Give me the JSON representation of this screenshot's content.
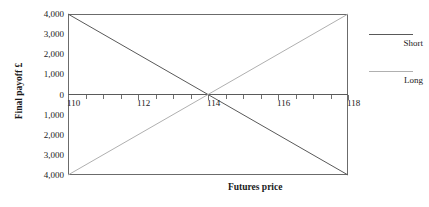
{
  "chart_data": {
    "type": "line",
    "title": "",
    "xlabel": "Futures price",
    "ylabel": "Final payoff £",
    "xlim": [
      110,
      118
    ],
    "ylim": [
      -4000,
      4000
    ],
    "grid": false,
    "legend_position": "right",
    "x": [
      110,
      118
    ],
    "series": [
      {
        "name": "Short",
        "values": [
          4000,
          -4000
        ],
        "color": "#595959"
      },
      {
        "name": "Long",
        "values": [
          -4000,
          4000
        ],
        "color": "#b0b0b0"
      }
    ],
    "xticks": [
      110,
      112,
      114,
      116,
      118
    ],
    "xtick_labels": [
      "110",
      "112",
      "114",
      "116",
      "118"
    ],
    "xtick_minor_step": 0.5,
    "yticks": [
      4000,
      3000,
      2000,
      1000,
      0,
      -1000,
      -2000,
      -3000,
      -4000
    ],
    "ytick_labels": [
      "4,000",
      "3,000",
      "2,000",
      "1,000",
      "0",
      "1,000",
      "2,000",
      "3,000",
      "4,000"
    ],
    "annotations": [
      {
        "text": "crossover",
        "x": 114,
        "y": 0
      }
    ]
  },
  "legend": {
    "items": [
      {
        "label": "Short",
        "color": "#595959"
      },
      {
        "label": "Long",
        "color": "#b0b0b0"
      }
    ]
  },
  "axes": {
    "x_title": "Futures price",
    "y_title": "Final payoff £"
  }
}
